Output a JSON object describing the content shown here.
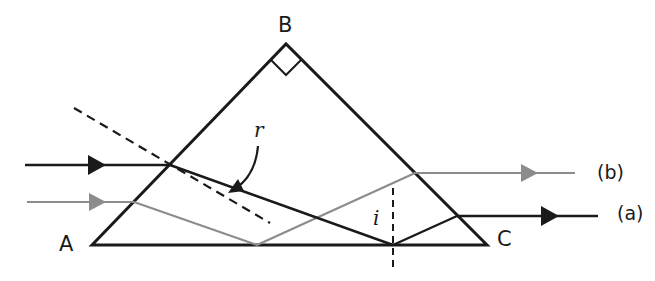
{
  "diagram": {
    "colors": {
      "prism_edge": "#1a1a1a",
      "ray_a": "#1a1a1a",
      "ray_b": "#8c8c8c",
      "normal": "#1a1a1a",
      "background": "#ffffff"
    },
    "vertices": {
      "A": {
        "label": "A",
        "x": 92,
        "y": 245
      },
      "B": {
        "label": "B",
        "x": 286,
        "y": 44
      },
      "C": {
        "label": "C",
        "x": 487,
        "y": 245
      }
    },
    "right_angle_at": "B",
    "rays": [
      {
        "id": "a",
        "label": "(a)",
        "color": "#1a1a1a",
        "path": [
          [
            25,
            165
          ],
          [
            170,
            165
          ],
          [
            393,
            245
          ],
          [
            457,
            216
          ],
          [
            598,
            216
          ]
        ]
      },
      {
        "id": "b",
        "label": "(b)",
        "color": "#8c8c8c",
        "path": [
          [
            27,
            202
          ],
          [
            134,
            202
          ],
          [
            257,
            245
          ],
          [
            415,
            173
          ],
          [
            575,
            173
          ]
        ]
      }
    ],
    "normals": [
      {
        "at": "face AB entry of ray a",
        "from": [
          74,
          108
        ],
        "to": [
          270,
          223
        ],
        "style": "dashed"
      },
      {
        "at": "face AC reflection of ray a",
        "from": [
          393,
          188
        ],
        "to": [
          393,
          268
        ],
        "style": "dashed"
      }
    ],
    "angle_labels": {
      "r": "r",
      "i": "i"
    },
    "ray_labels": {
      "a": "(a)",
      "b": "(b)"
    }
  }
}
